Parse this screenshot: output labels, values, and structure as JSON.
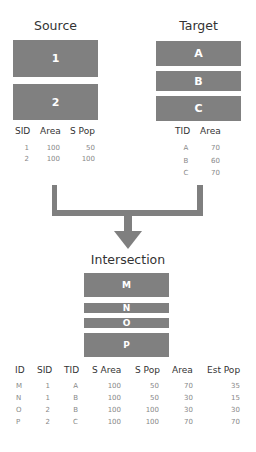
{
  "source": {
    "title": "Source",
    "polygons": [
      "1",
      "2"
    ],
    "table": {
      "headers": [
        "SID",
        "Area",
        "S Pop"
      ],
      "rows": [
        [
          "1",
          "100",
          "50"
        ],
        [
          "2",
          "100",
          "100"
        ]
      ]
    }
  },
  "target": {
    "title": "Target",
    "polygons": [
      "A",
      "B",
      "C"
    ],
    "table": {
      "headers": [
        "TID",
        "Area"
      ],
      "rows": [
        [
          "A",
          "70"
        ],
        [
          "B",
          "60"
        ],
        [
          "C",
          "70"
        ]
      ]
    }
  },
  "intersection": {
    "title": "Intersection",
    "polygons": [
      "M",
      "N",
      "O",
      "P"
    ],
    "table": {
      "headers": [
        "ID",
        "SID",
        "TID",
        "S Area",
        "S Pop",
        "Area",
        "Est Pop"
      ],
      "rows": [
        [
          "M",
          "1",
          "A",
          "100",
          "50",
          "70",
          "35"
        ],
        [
          "N",
          "1",
          "B",
          "100",
          "50",
          "30",
          "15"
        ],
        [
          "O",
          "2",
          "B",
          "100",
          "100",
          "30",
          "30"
        ],
        [
          "P",
          "2",
          "C",
          "100",
          "100",
          "70",
          "70"
        ]
      ]
    }
  },
  "colors": {
    "polygon_fill": "#808080",
    "connector": "#7f7f7f",
    "cell_text": "#888888"
  }
}
